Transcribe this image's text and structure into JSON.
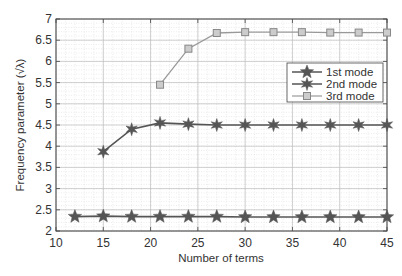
{
  "chart_data": {
    "type": "line",
    "title": "",
    "xlabel": "Number of terms",
    "ylabel": "Frequency parameter (√λ)",
    "xlim": [
      10,
      45
    ],
    "ylim": [
      2,
      7
    ],
    "xticks": [
      10,
      15,
      20,
      25,
      30,
      35,
      40,
      45
    ],
    "yticks": [
      2,
      2.5,
      3,
      3.5,
      4,
      4.5,
      5,
      5.5,
      6,
      6.5,
      7
    ],
    "grid": true,
    "minor_grid": true,
    "legend_position": "upper right (inside)",
    "series": [
      {
        "name": "1st mode",
        "marker": "star5",
        "color": "#555555",
        "x": [
          12,
          15,
          18,
          21,
          24,
          27,
          30,
          33,
          36,
          39,
          42,
          45
        ],
        "values": [
          2.34,
          2.35,
          2.34,
          2.34,
          2.34,
          2.34,
          2.33,
          2.33,
          2.33,
          2.33,
          2.33,
          2.33
        ]
      },
      {
        "name": "2nd mode",
        "marker": "star6",
        "color": "#555555",
        "x": [
          15,
          18,
          21,
          24,
          27,
          30,
          33,
          36,
          39,
          42,
          45
        ],
        "values": [
          3.87,
          4.4,
          4.55,
          4.52,
          4.5,
          4.5,
          4.5,
          4.5,
          4.5,
          4.5,
          4.5
        ]
      },
      {
        "name": "3rd mode",
        "marker": "square",
        "color": "#999999",
        "x": [
          21,
          24,
          27,
          30,
          33,
          36,
          39,
          42,
          45
        ],
        "values": [
          5.45,
          6.3,
          6.67,
          6.69,
          6.69,
          6.69,
          6.68,
          6.68,
          6.68
        ]
      }
    ]
  }
}
